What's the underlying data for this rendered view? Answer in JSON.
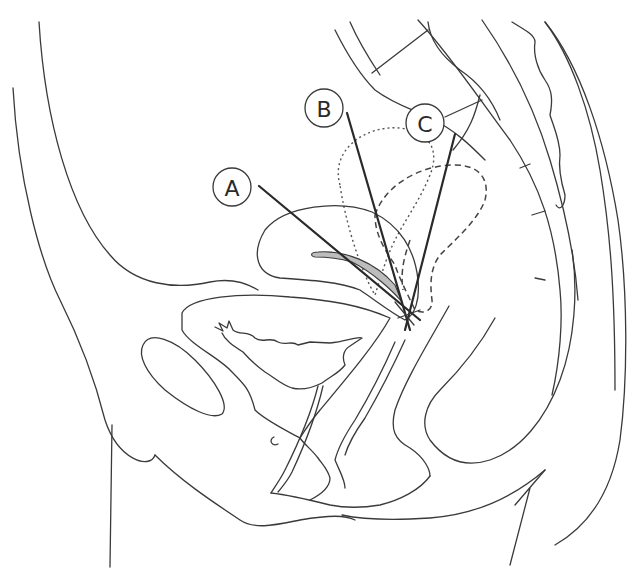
{
  "figure": {
    "type": "sagittal pelvic anatomy line drawing",
    "labels": [
      {
        "id": "A",
        "text": "A",
        "position": "anteverted/anteflexed"
      },
      {
        "id": "B",
        "text": "B",
        "position": "midposition"
      },
      {
        "id": "C",
        "text": "C",
        "position": "retroverted"
      }
    ],
    "colors": {
      "line": "#3a3a3a",
      "position_B_fill": "#eeeeee",
      "position_C_fill": "#c4c4c4",
      "position_A_cavity_fill": "#bdbdbd",
      "background": "#ffffff"
    }
  }
}
